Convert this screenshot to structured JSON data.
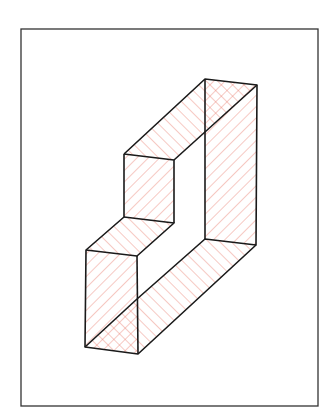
{
  "figure": {
    "title": "Isometric hatched Z-shaped prism",
    "frame": {
      "x": 21,
      "y": 29,
      "width": 297,
      "height": 377
    },
    "colors": {
      "outline": "#1a1a1a",
      "hatch": "#e8786a",
      "background": "#ffffff"
    },
    "vertices": {
      "top_back_left": [
        205,
        79
      ],
      "top_back_right": [
        257,
        85
      ],
      "upper_left_top": [
        124,
        154
      ],
      "upper_inner": [
        174,
        160
      ],
      "back_mid": [
        205,
        131
      ],
      "step_left": [
        124,
        217
      ],
      "step_inner": [
        174,
        223
      ],
      "lower_left_top": [
        86,
        250
      ],
      "lower_front_top": [
        137,
        256
      ],
      "back_inner_bottom": [
        205,
        239
      ],
      "right_bottom": [
        256,
        245
      ],
      "front_cross": [
        137,
        299
      ],
      "bottom_left": [
        85,
        347
      ],
      "bottom_right": [
        138,
        354
      ]
    },
    "faces": [
      {
        "name": "top-right-cap",
        "hatch": "cross"
      },
      {
        "name": "upper-top-slab",
        "hatch": "single"
      },
      {
        "name": "right-tall-face",
        "hatch": "single"
      },
      {
        "name": "upper-front-face",
        "hatch": "single"
      },
      {
        "name": "step-top-slab",
        "hatch": "single"
      },
      {
        "name": "lower-front-face",
        "hatch": "single"
      },
      {
        "name": "bottom-diagonal-slab",
        "hatch": "single"
      },
      {
        "name": "bottom-left-cap",
        "hatch": "cross"
      }
    ]
  }
}
